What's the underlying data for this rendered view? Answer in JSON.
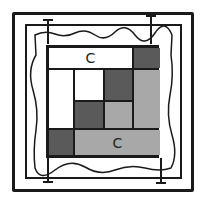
{
  "diagram": {
    "colors": {
      "line": "#1a1a1a",
      "white": "#ffffff",
      "dark": "#5a5a5a",
      "light": "#a8a8a8"
    },
    "cells": [
      {
        "id": "top-bar",
        "tone": "white",
        "label": "C"
      },
      {
        "id": "top-right",
        "tone": "dark",
        "label": ""
      },
      {
        "id": "left-tall",
        "tone": "white",
        "label": ""
      },
      {
        "id": "mid-top-left",
        "tone": "white",
        "label": ""
      },
      {
        "id": "mid-top-right",
        "tone": "dark",
        "label": ""
      },
      {
        "id": "right-tall",
        "tone": "light",
        "label": ""
      },
      {
        "id": "mid-bottom-left",
        "tone": "dark",
        "label": ""
      },
      {
        "id": "mid-bottom-right",
        "tone": "light",
        "label": ""
      },
      {
        "id": "bottom-left",
        "tone": "dark",
        "label": ""
      },
      {
        "id": "bottom-bar",
        "tone": "light",
        "label": "C"
      }
    ]
  }
}
